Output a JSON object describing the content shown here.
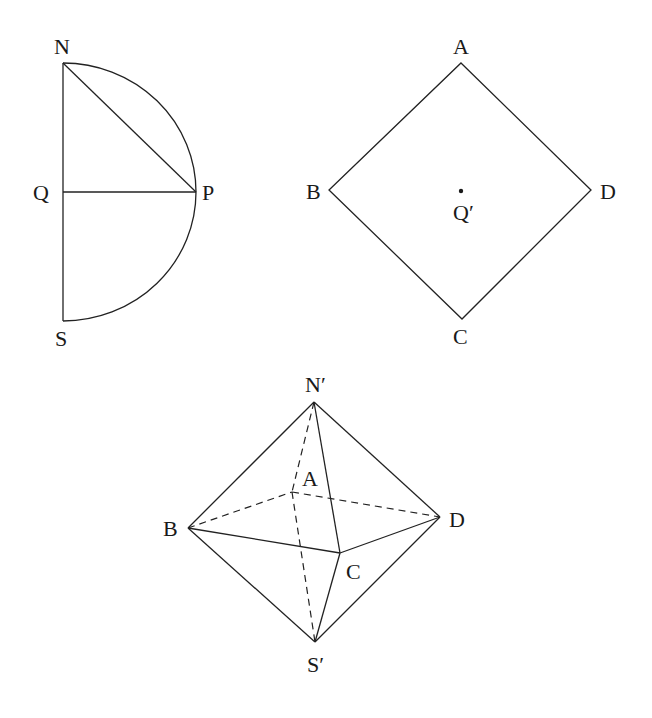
{
  "figure1": {
    "title": "Semicircle",
    "labels": {
      "N": "N",
      "Q": "Q",
      "P": "P",
      "S": "S"
    }
  },
  "figure2": {
    "title": "Square",
    "labels": {
      "A": "A",
      "B": "B",
      "C": "C",
      "D": "D",
      "Qp": "Q′"
    }
  },
  "figure3": {
    "title": "Octahedron",
    "labels": {
      "Np": "N′",
      "A": "A",
      "B": "B",
      "C": "C",
      "D": "D",
      "Sp": "S′"
    }
  },
  "colors": {
    "stroke": "#222222",
    "background": "#ffffff"
  }
}
